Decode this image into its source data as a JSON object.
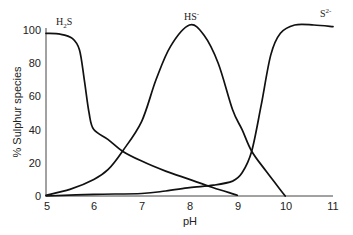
{
  "chart_data": {
    "type": "line",
    "title": "",
    "xlabel": "pH",
    "ylabel": "% Sulphur species",
    "xlim": [
      5,
      11
    ],
    "ylim": [
      0,
      100
    ],
    "x_ticks": [
      5,
      6,
      7,
      8,
      9,
      10,
      11
    ],
    "y_ticks": [
      0,
      20,
      40,
      60,
      80,
      100
    ],
    "grid": false,
    "legend": "inline labels",
    "series": [
      {
        "name": "H2S",
        "label_main": "H",
        "label_sub": "2",
        "label_tail": "S",
        "points": [
          [
            5.0,
            98
          ],
          [
            5.3,
            97.5
          ],
          [
            5.55,
            95
          ],
          [
            5.7,
            88
          ],
          [
            5.8,
            70
          ],
          [
            5.9,
            50
          ],
          [
            6.0,
            40
          ],
          [
            6.3,
            34
          ],
          [
            6.6,
            27
          ],
          [
            7.0,
            21
          ],
          [
            7.5,
            15
          ],
          [
            8.0,
            10
          ],
          [
            8.5,
            5
          ],
          [
            9.0,
            0.5
          ]
        ]
      },
      {
        "name": "HS-",
        "label_main": "HS",
        "label_sup": "-",
        "points": [
          [
            5.0,
            0.5
          ],
          [
            5.5,
            4
          ],
          [
            6.0,
            10
          ],
          [
            6.3,
            16
          ],
          [
            6.6,
            27
          ],
          [
            7.0,
            45
          ],
          [
            7.3,
            70
          ],
          [
            7.6,
            90
          ],
          [
            8.0,
            103
          ],
          [
            8.3,
            97
          ],
          [
            8.6,
            80
          ],
          [
            8.9,
            52
          ],
          [
            9.1,
            40
          ],
          [
            9.3,
            27
          ],
          [
            9.6,
            15
          ],
          [
            10.0,
            0
          ]
        ]
      },
      {
        "name": "S2-",
        "label_main": "S",
        "label_sup": "2-",
        "points": [
          [
            5.0,
            0
          ],
          [
            6.0,
            1
          ],
          [
            7.0,
            1.5
          ],
          [
            7.5,
            3
          ],
          [
            8.0,
            5
          ],
          [
            8.5,
            6.5
          ],
          [
            8.9,
            9
          ],
          [
            9.1,
            14
          ],
          [
            9.3,
            27
          ],
          [
            9.5,
            55
          ],
          [
            9.7,
            85
          ],
          [
            9.9,
            98
          ],
          [
            10.2,
            103
          ],
          [
            10.6,
            103
          ],
          [
            11.0,
            102
          ]
        ]
      }
    ]
  },
  "axes": {
    "x_title": "pH",
    "y_title": "% Sulphur species",
    "x_ticks": [
      "5",
      "6",
      "7",
      "8",
      "9",
      "10",
      "11"
    ],
    "y_ticks": [
      "0",
      "20",
      "40",
      "60",
      "80",
      "100"
    ]
  }
}
